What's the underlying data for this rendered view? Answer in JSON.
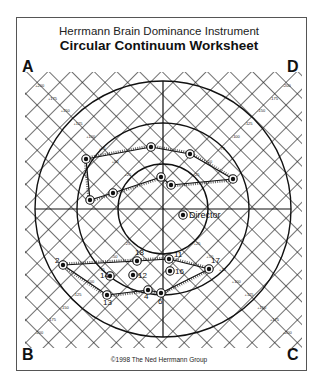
{
  "header": {
    "title": "Herrmann Brain Dominance Instrument",
    "subtitle": "Circular Continuum Worksheet"
  },
  "quadrants": {
    "top_left": "A",
    "top_right": "D",
    "bottom_left": "B",
    "bottom_right": "C"
  },
  "footer": {
    "copyright": "©1998 The Ned Herrmann Group"
  },
  "diagram": {
    "center": [
      163,
      209
    ],
    "circle_radii": [
      45,
      86,
      128
    ],
    "axis_tick_labels": [
      "+200",
      "+175",
      "+150",
      "+125",
      "+100",
      "+75",
      "+50",
      "+25"
    ],
    "director": {
      "label": "Director",
      "x": 183,
      "y": 215
    },
    "upper_cluster": {
      "points": [
        [
          86,
          159
        ],
        [
          151,
          147
        ],
        [
          190,
          154
        ],
        [
          233,
          179
        ],
        [
          171,
          185
        ],
        [
          161,
          177
        ],
        [
          113,
          193
        ],
        [
          90,
          200
        ]
      ]
    },
    "lower_cluster": {
      "points": [
        {
          "label": "2",
          "x": 63,
          "y": 265
        },
        {
          "label": "18",
          "x": 137,
          "y": 261
        },
        {
          "label": "11",
          "x": 169,
          "y": 259
        },
        {
          "label": "17",
          "x": 209,
          "y": 269
        },
        {
          "label": "16",
          "x": 170,
          "y": 271
        },
        {
          "label": "12",
          "x": 133,
          "y": 275
        },
        {
          "label": "14",
          "x": 110,
          "y": 276
        },
        {
          "label": "13",
          "x": 107,
          "y": 295
        },
        {
          "label": "4",
          "x": 148,
          "y": 290
        },
        {
          "label": "6",
          "x": 161,
          "y": 293
        }
      ]
    }
  }
}
